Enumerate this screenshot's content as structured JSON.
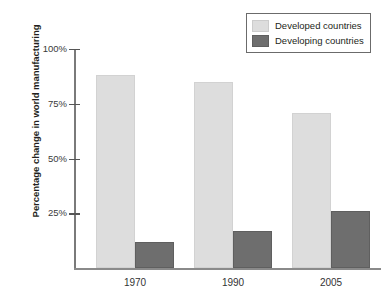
{
  "chart_data": {
    "type": "bar",
    "title": "",
    "xlabel": "",
    "ylabel": "Percentage change in world manufacturing",
    "categories": [
      "1970",
      "1990",
      "2005"
    ],
    "series": [
      {
        "name": "Developed countries",
        "values": [
          88,
          85,
          71
        ],
        "color": "#dddddd"
      },
      {
        "name": "Developing countries",
        "values": [
          12,
          17,
          26
        ],
        "color": "#6e6e6e"
      }
    ],
    "ylim": [
      0,
      108
    ],
    "yticks": [
      25,
      50,
      75,
      100
    ],
    "ytick_labels": [
      "25%",
      "50%",
      "75%",
      "100%"
    ],
    "grid": false,
    "legend_position": "top-right"
  },
  "axis": {
    "y_title": "Percentage change in world manufacturing",
    "tick_labels": {
      "t100": "100%",
      "t75": "75%",
      "t50": "50%",
      "t25": "25%"
    },
    "x_labels": {
      "c0": "1970",
      "c1": "1990",
      "c2": "2005"
    }
  },
  "legend": {
    "items": [
      {
        "label": "Developed countries"
      },
      {
        "label": "Developing countries"
      }
    ]
  },
  "colors": {
    "light_bar": "#dddddd",
    "dark_bar": "#6e6e6e",
    "axis": "#7a7a7a",
    "text": "#231f20"
  }
}
